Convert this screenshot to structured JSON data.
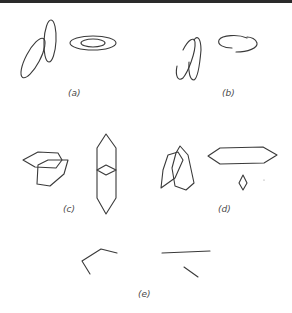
{
  "figure": {
    "panels": [
      {
        "id": "a",
        "label": "(a)",
        "description": "Two overlapping tilted ellipses; two concentric horizontal ellipses"
      },
      {
        "id": "b",
        "label": "(b)",
        "description": "Broken overlapping ellipses; broken horizontal ellipse"
      },
      {
        "id": "c",
        "label": "(c)",
        "description": "Two overlapping hexagons; vertical elongated hexagon with inner diamond"
      },
      {
        "id": "d",
        "label": "(d)",
        "description": "Two overlapping tilted hexagons; horizontal elongated hexagon with separate small diamond"
      },
      {
        "id": "e",
        "label": "(e)",
        "description": "Fragmentary line segments of hexagon contours"
      }
    ],
    "stroke_color": "#3a3a3a",
    "background_color": "#ffffff"
  }
}
